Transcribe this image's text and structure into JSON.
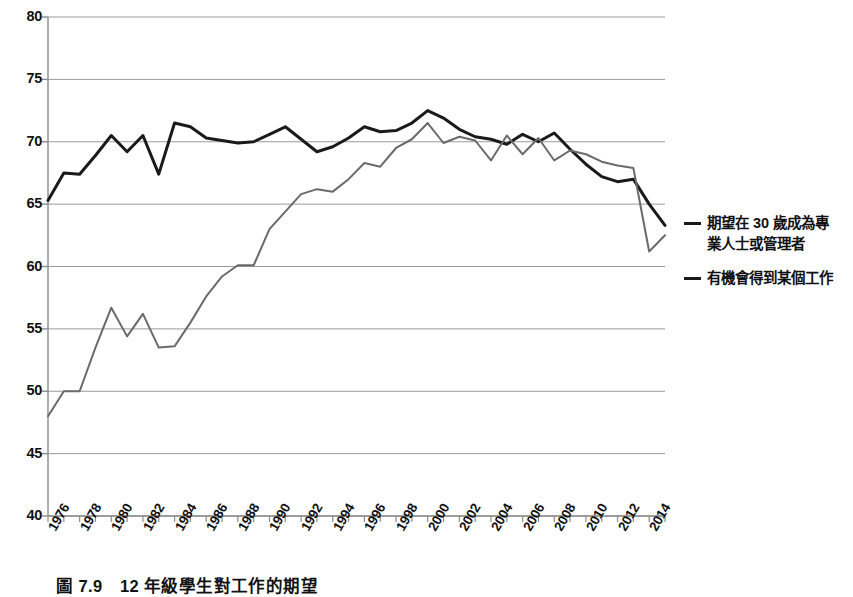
{
  "caption": "圖 7.9　12 年級學生對工作的期望",
  "legend": {
    "position": "right",
    "entries": [
      {
        "name": "legend-series-1",
        "label": "期望在 30 歲成為專業人士或管理者",
        "color": "#1a1a1a"
      },
      {
        "name": "legend-series-2",
        "label": "有機會得到某個工作",
        "color": "#1a1a1a"
      }
    ]
  },
  "axes": {
    "y_ticks": [
      "80",
      "75",
      "70",
      "65",
      "60",
      "55",
      "50",
      "45",
      "40"
    ],
    "x_ticks": [
      "1976",
      "1978",
      "1980",
      "1982",
      "1984",
      "1986",
      "1988",
      "1990",
      "1992",
      "1994",
      "1996",
      "1998",
      "2000",
      "2002",
      "2004",
      "2006",
      "2008",
      "2010",
      "2012",
      "2014"
    ]
  },
  "chart_data": {
    "type": "line",
    "title": "圖 7.9　12 年級學生對工作的期望",
    "xlabel": "",
    "ylabel": "",
    "xlim": [
      1976,
      2015
    ],
    "ylim": [
      40,
      80
    ],
    "grid": true,
    "legend_position": "right",
    "x": [
      1976,
      1977,
      1978,
      1979,
      1980,
      1981,
      1982,
      1983,
      1984,
      1985,
      1986,
      1987,
      1988,
      1989,
      1990,
      1991,
      1992,
      1993,
      1994,
      1995,
      1996,
      1997,
      1998,
      1999,
      2000,
      2001,
      2002,
      2003,
      2004,
      2005,
      2006,
      2007,
      2008,
      2009,
      2010,
      2011,
      2012,
      2013,
      2014,
      2015
    ],
    "series": [
      {
        "name": "期望在 30 歲成為專業人士或管理者",
        "color": "#1a1a1a",
        "width": 3,
        "values": [
          65.3,
          67.5,
          67.4,
          68.9,
          70.5,
          69.2,
          70.5,
          67.4,
          71.5,
          71.2,
          70.3,
          70.1,
          69.9,
          70.0,
          70.6,
          71.2,
          70.2,
          69.2,
          69.6,
          70.3,
          71.2,
          70.8,
          70.9,
          71.5,
          72.5,
          71.9,
          71.0,
          70.4,
          70.2,
          69.8,
          70.6,
          70.0,
          70.7,
          69.4,
          68.2,
          67.2,
          66.8,
          67.0,
          65.0,
          63.3
        ]
      },
      {
        "name": "有機會得到某個工作",
        "color": "#6a6a6a",
        "width": 2,
        "values": [
          48.0,
          50.0,
          50.0,
          53.5,
          56.7,
          54.4,
          56.2,
          53.5,
          53.6,
          55.5,
          57.6,
          59.2,
          60.1,
          60.1,
          63.0,
          64.4,
          65.8,
          66.2,
          66.0,
          67.0,
          68.3,
          68.0,
          69.5,
          70.2,
          71.5,
          69.9,
          70.4,
          70.1,
          68.5,
          70.5,
          69.0,
          70.3,
          68.5,
          69.3,
          69.0,
          68.4,
          68.1,
          67.9,
          61.2,
          62.5
        ]
      }
    ]
  }
}
